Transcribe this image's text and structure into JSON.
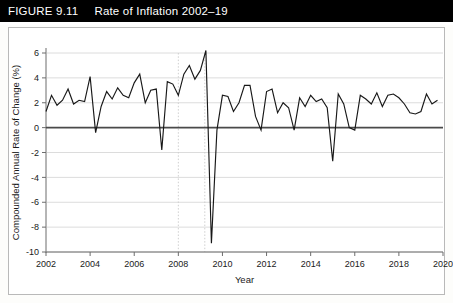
{
  "figure": {
    "number_label": "FIGURE 9.11",
    "title": "Rate of Inflation 2002–19"
  },
  "chart_data": {
    "type": "line",
    "title": "Rate of Inflation 2002–19",
    "xlabel": "Year",
    "ylabel": "Compounded Annual Rate of Change (%)",
    "xlim": [
      2002,
      2020
    ],
    "ylim": [
      -10,
      6
    ],
    "grid": true,
    "legend": "none",
    "x_ticks": [
      "2002",
      "2004",
      "2006",
      "2008",
      "2010",
      "2012",
      "2014",
      "2016",
      "2018",
      "2020"
    ],
    "x_tick_values": [
      2002,
      2004,
      2006,
      2008,
      2010,
      2012,
      2014,
      2016,
      2018,
      2020
    ],
    "y_ticks": [
      "6",
      "4",
      "2",
      "0",
      "-2",
      "-4",
      "-6",
      "-8",
      "-10"
    ],
    "y_tick_values": [
      6,
      4,
      2,
      0,
      -2,
      -4,
      -6,
      -8,
      -10
    ],
    "annotations": [
      {
        "type": "vertical-line",
        "x": 2008.0,
        "style": "dotted",
        "label": "recession start marker"
      },
      {
        "type": "vertical-line",
        "x": 2009.2,
        "style": "dotted",
        "label": "recession end marker"
      },
      {
        "type": "horizontal-line",
        "y": 0,
        "style": "solid",
        "label": "zero reference line"
      }
    ],
    "series": [
      {
        "name": "Compounded Annual Rate of Change (%)",
        "frequency": "quarterly",
        "x": [
          2002.0,
          2002.25,
          2002.5,
          2002.75,
          2003.0,
          2003.25,
          2003.5,
          2003.75,
          2004.0,
          2004.25,
          2004.5,
          2004.75,
          2005.0,
          2005.25,
          2005.5,
          2005.75,
          2006.0,
          2006.25,
          2006.5,
          2006.75,
          2007.0,
          2007.25,
          2007.5,
          2007.75,
          2008.0,
          2008.25,
          2008.5,
          2008.75,
          2009.0,
          2009.25,
          2009.5,
          2009.75,
          2010.0,
          2010.25,
          2010.5,
          2010.75,
          2011.0,
          2011.25,
          2011.5,
          2011.75,
          2012.0,
          2012.25,
          2012.5,
          2012.75,
          2013.0,
          2013.25,
          2013.5,
          2013.75,
          2014.0,
          2014.25,
          2014.5,
          2014.75,
          2015.0,
          2015.25,
          2015.5,
          2015.75,
          2016.0,
          2016.25,
          2016.5,
          2016.75,
          2017.0,
          2017.25,
          2017.5,
          2017.75,
          2018.0,
          2018.25,
          2018.5,
          2018.75,
          2019.0,
          2019.25,
          2019.5,
          2019.75
        ],
        "values": [
          1.3,
          2.6,
          1.8,
          2.2,
          3.1,
          1.9,
          2.2,
          2.1,
          4.1,
          -0.4,
          1.7,
          2.9,
          2.3,
          3.2,
          2.6,
          2.4,
          3.6,
          4.3,
          2.0,
          3.0,
          3.1,
          -1.8,
          3.7,
          3.5,
          2.6,
          4.3,
          5.0,
          3.9,
          4.6,
          6.2,
          -9.3,
          -0.2,
          2.6,
          2.5,
          1.3,
          2.0,
          3.4,
          3.4,
          0.9,
          -0.2,
          2.9,
          3.1,
          1.2,
          2.0,
          1.6,
          -0.2,
          2.4,
          1.7,
          2.6,
          2.1,
          2.3,
          1.6,
          -2.7,
          2.7,
          1.9,
          0.0,
          -0.2,
          2.6,
          2.3,
          1.9,
          2.8,
          1.7,
          2.6,
          2.7,
          2.4,
          1.9,
          1.2,
          1.1,
          1.3,
          2.7,
          1.9,
          2.2
        ]
      }
    ]
  },
  "axes": {
    "y_axis_title": "Compounded Annual Rate of Change (%)",
    "x_axis_title": "Year"
  }
}
